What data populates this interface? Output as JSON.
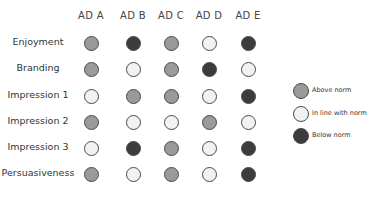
{
  "chart_data": {
    "type": "table",
    "title": "",
    "columns": [
      "AD A",
      "AD B",
      "AD C",
      "AD D",
      "AD E"
    ],
    "rows": [
      "Enjoyment",
      "Branding",
      "Impression 1",
      "Impression 2",
      "Impression 3",
      "Persuasiveness"
    ],
    "values": [
      [
        "above",
        "below",
        "above",
        "inline",
        "below"
      ],
      [
        "above",
        "inline",
        "above",
        "below",
        "inline"
      ],
      [
        "inline",
        "above",
        "above",
        "inline",
        "below"
      ],
      [
        "above",
        "inline",
        "inline",
        "above",
        "inline"
      ],
      [
        "inline",
        "below",
        "above",
        "inline",
        "below"
      ],
      [
        "above",
        "inline",
        "above",
        "inline",
        "below"
      ]
    ],
    "legend": [
      {
        "key": "above",
        "label": "Above norm",
        "color": "#9a9a9a"
      },
      {
        "key": "inline",
        "label": "In line with norm",
        "color": "#f2f2f2"
      },
      {
        "key": "below",
        "label": "Below norm",
        "color": "#3c3c3c"
      }
    ],
    "legend_position": "right"
  }
}
